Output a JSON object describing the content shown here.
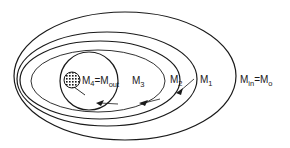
{
  "diagram": {
    "type": "nested-ellipses",
    "labels": {
      "m4": "M",
      "m4_sub": "4",
      "eq1": "=M",
      "out_sub": "out",
      "m3": "M",
      "m3_sub": "3",
      "m2": "M",
      "m2_sub": "2",
      "m1": "M",
      "m1_sub": "1",
      "min": "M",
      "min_sub": "in",
      "eq2": "=M",
      "m0_sub": "o"
    },
    "colors": {
      "stroke": "#1a1a1a",
      "background": "#ffffff"
    },
    "regions": [
      {
        "name": "M_in = M_o",
        "shape": "ellipse",
        "cx": 125,
        "cy": 76,
        "rx": 111,
        "ry": 64
      },
      {
        "name": "M_1",
        "shape": "ellipse",
        "cx": 107,
        "cy": 79,
        "rx": 90,
        "ry": 47
      },
      {
        "name": "M_2",
        "shape": "ellipse",
        "cx": 100,
        "cy": 80,
        "rx": 80,
        "ry": 39
      },
      {
        "name": "M_3",
        "shape": "ellipse",
        "cx": 98,
        "cy": 81,
        "rx": 67,
        "ry": 31
      },
      {
        "name": "M_4 = M_out",
        "shape": "circle",
        "cx": 89,
        "cy": 81,
        "r": 29
      },
      {
        "name": "sink",
        "shape": "hatched-disc",
        "cx": 72,
        "cy": 80,
        "r": 8
      }
    ]
  }
}
